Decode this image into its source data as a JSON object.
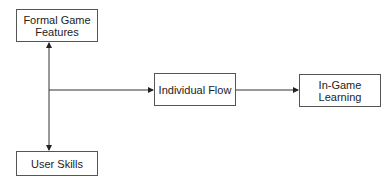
{
  "diagram": {
    "type": "flow",
    "nodes": {
      "formal_game_features": "Formal Game\nFeatures",
      "user_skills": "User Skills",
      "individual_flow": "Individual Flow",
      "in_game_learning": "In-Game\nLearning"
    },
    "edges": [
      {
        "from": "formal_game_features",
        "to": "user_skills",
        "style": "bidirectional"
      },
      {
        "from": "formal_game_features+user_skills",
        "to": "individual_flow",
        "style": "arrow"
      },
      {
        "from": "individual_flow",
        "to": "in_game_learning",
        "style": "arrow"
      }
    ],
    "colors": {
      "line": "#333333",
      "border": "#555555",
      "text": "#222222",
      "background": "#ffffff"
    }
  }
}
